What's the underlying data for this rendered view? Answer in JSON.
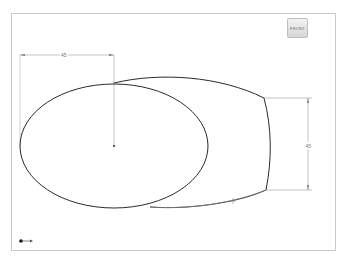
{
  "viewport": {
    "view_cube_label": "FRONT",
    "background": "#ffffff",
    "border_color": "#c8c8c8"
  },
  "sketch": {
    "ellipse": {
      "cx": 114,
      "cy": 146,
      "rx": 94,
      "ry": 62,
      "stroke": "#2a2a2a"
    },
    "center_point": {
      "x": 114,
      "y": 146
    },
    "dimensions": {
      "horizontal": {
        "label": "45",
        "x1": 20,
        "x2": 114,
        "y": 55
      },
      "vertical": {
        "label": "45",
        "x": 308,
        "y1": 98,
        "y2": 190
      }
    },
    "dimension_color": "#9a9a9a",
    "line_color": "#2a2a2a"
  },
  "triad": {
    "x_label": "",
    "y_label": ""
  }
}
